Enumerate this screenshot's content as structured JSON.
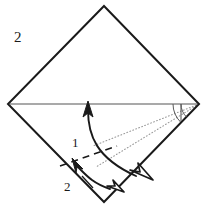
{
  "figure": {
    "kind": "origami-fold-diagram",
    "step_number": "2",
    "background_color": "#ffffff",
    "ink_color": "#1a1a1a",
    "crease_color": "#888888",
    "guide_color": "#9a9a9a"
  },
  "labels": {
    "step": "2",
    "fold_one": "1",
    "fold_two": "2"
  },
  "shape": {
    "name": "square-rotated-45",
    "description": "paper square standing on a corner (diamond)",
    "vertices": {
      "top": [
        104,
        6
      ],
      "right": [
        199,
        104
      ],
      "bottom": [
        104,
        202
      ],
      "left": [
        8,
        104
      ]
    }
  },
  "creases": [
    {
      "name": "horizontal-diagonal-crease",
      "style": "solid",
      "color": "#888888",
      "from": [
        10,
        104
      ],
      "to": [
        197,
        104
      ]
    },
    {
      "name": "short-vertical-tick",
      "style": "solid",
      "color": "#555555",
      "from": [
        181,
        104
      ],
      "to": [
        181,
        120
      ]
    },
    {
      "name": "valley-fold-dashed-line",
      "style": "dashed",
      "color": "#1a1a1a",
      "from": [
        61,
        165
      ],
      "to": [
        116,
        147
      ]
    }
  ],
  "guides": [
    {
      "name": "dotted-guide-upper",
      "style": "dotted",
      "color": "#9a9a9a",
      "from": [
        199,
        104
      ],
      "to": [
        93,
        146
      ]
    },
    {
      "name": "dotted-guide-lower",
      "style": "dotted",
      "color": "#9a9a9a",
      "from": [
        199,
        104
      ],
      "to": [
        96,
        167
      ]
    }
  ],
  "arcs": [
    {
      "name": "angle-arc-outer",
      "color": "#555555",
      "center": [
        199,
        104
      ]
    },
    {
      "name": "angle-arc-inner",
      "color": "#555555",
      "center": [
        199,
        104
      ]
    }
  ],
  "arrows": [
    {
      "name": "fold-arrow-1",
      "label": "1",
      "head_style": "solid",
      "direction": "up",
      "tip": [
        88,
        103
      ],
      "tail": [
        137,
        175
      ],
      "description": "large curved arrow sweeping from lower right up to the horizontal crease"
    },
    {
      "name": "fold-arrow-1-return",
      "label": "1",
      "head_style": "hollow",
      "direction": "down-right",
      "tip": [
        146,
        178
      ],
      "description": "hollow triangular arrowhead at the lower end of arrow 1"
    },
    {
      "name": "fold-arrow-2",
      "label": "2",
      "head_style": "solid",
      "direction": "up-left",
      "tip": [
        74,
        162
      ],
      "tail": [
        102,
        190
      ],
      "description": "small curved arrow pointing up toward the dashed valley fold"
    },
    {
      "name": "fold-arrow-2-return",
      "label": "2",
      "head_style": "hollow",
      "direction": "down-right",
      "tip": [
        118,
        190
      ],
      "description": "hollow triangular arrowhead at the lower end of arrow 2"
    }
  ]
}
